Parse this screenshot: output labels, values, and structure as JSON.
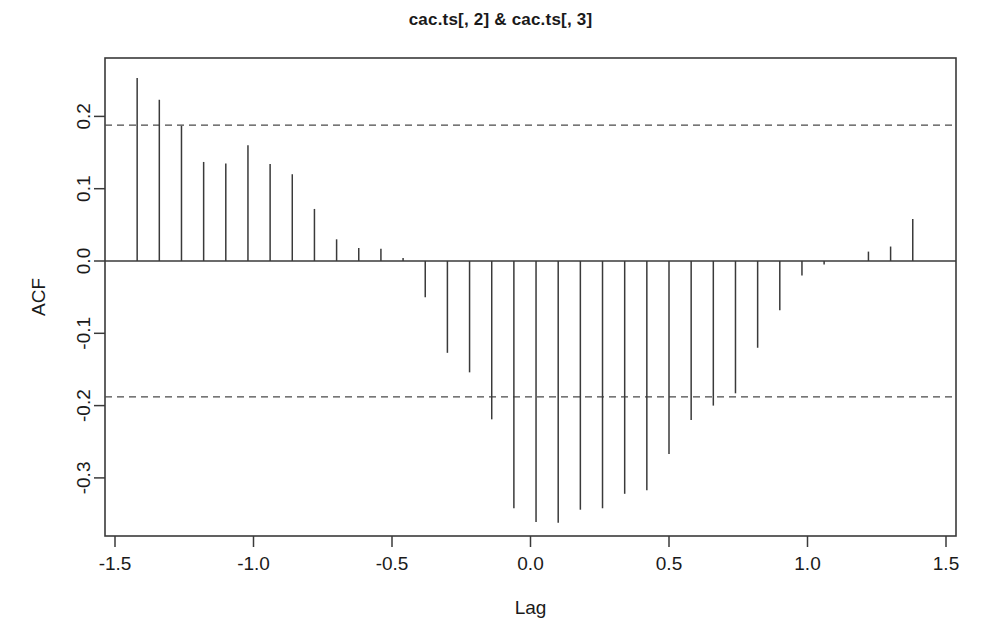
{
  "chart_data": {
    "type": "bar",
    "title": "cac.ts[, 2] & cac.ts[, 3]",
    "xlabel": "Lag",
    "ylabel": "ACF",
    "xlim": [
      -1.5,
      1.5
    ],
    "ylim": [
      -0.375,
      0.285
    ],
    "grid": false,
    "legend": "none",
    "xticks": [
      "-1.5",
      "-1.0",
      "-0.5",
      "0.0",
      "0.5",
      "1.0",
      "1.5"
    ],
    "xtick_values": [
      -1.5,
      -1.0,
      -0.5,
      0.0,
      0.5,
      1.0,
      1.5
    ],
    "yticks": [
      "0.2",
      "0.1",
      "0.0",
      "-0.1",
      "-0.2",
      "-0.3"
    ],
    "ytick_values": [
      0.2,
      0.1,
      0.0,
      -0.1,
      -0.2,
      -0.3
    ],
    "confidence_bands": [
      0.188,
      -0.188
    ],
    "confidence_style": "dashed",
    "x": [
      -1.42,
      -1.34,
      -1.26,
      -1.18,
      -1.1,
      -1.02,
      -0.94,
      -0.86,
      -0.78,
      -0.7,
      -0.62,
      -0.54,
      -0.46,
      -0.38,
      -0.3,
      -0.22,
      -0.14,
      -0.06,
      0.02,
      0.1,
      0.18,
      0.26,
      0.34,
      0.42,
      0.5,
      0.58,
      0.66,
      0.74,
      0.82,
      0.9,
      0.98,
      1.06,
      1.14,
      1.22,
      1.3,
      1.38
    ],
    "values": [
      0.253,
      0.223,
      0.187,
      0.137,
      0.135,
      0.16,
      0.134,
      0.12,
      0.072,
      0.03,
      0.018,
      0.017,
      0.004,
      -0.05,
      -0.127,
      -0.154,
      -0.219,
      -0.342,
      -0.361,
      -0.362,
      -0.344,
      -0.342,
      -0.322,
      -0.317,
      -0.267,
      -0.22,
      -0.2,
      -0.183,
      -0.12,
      -0.068,
      -0.02,
      -0.005,
      0.0,
      0.013,
      0.02,
      0.058
    ]
  }
}
